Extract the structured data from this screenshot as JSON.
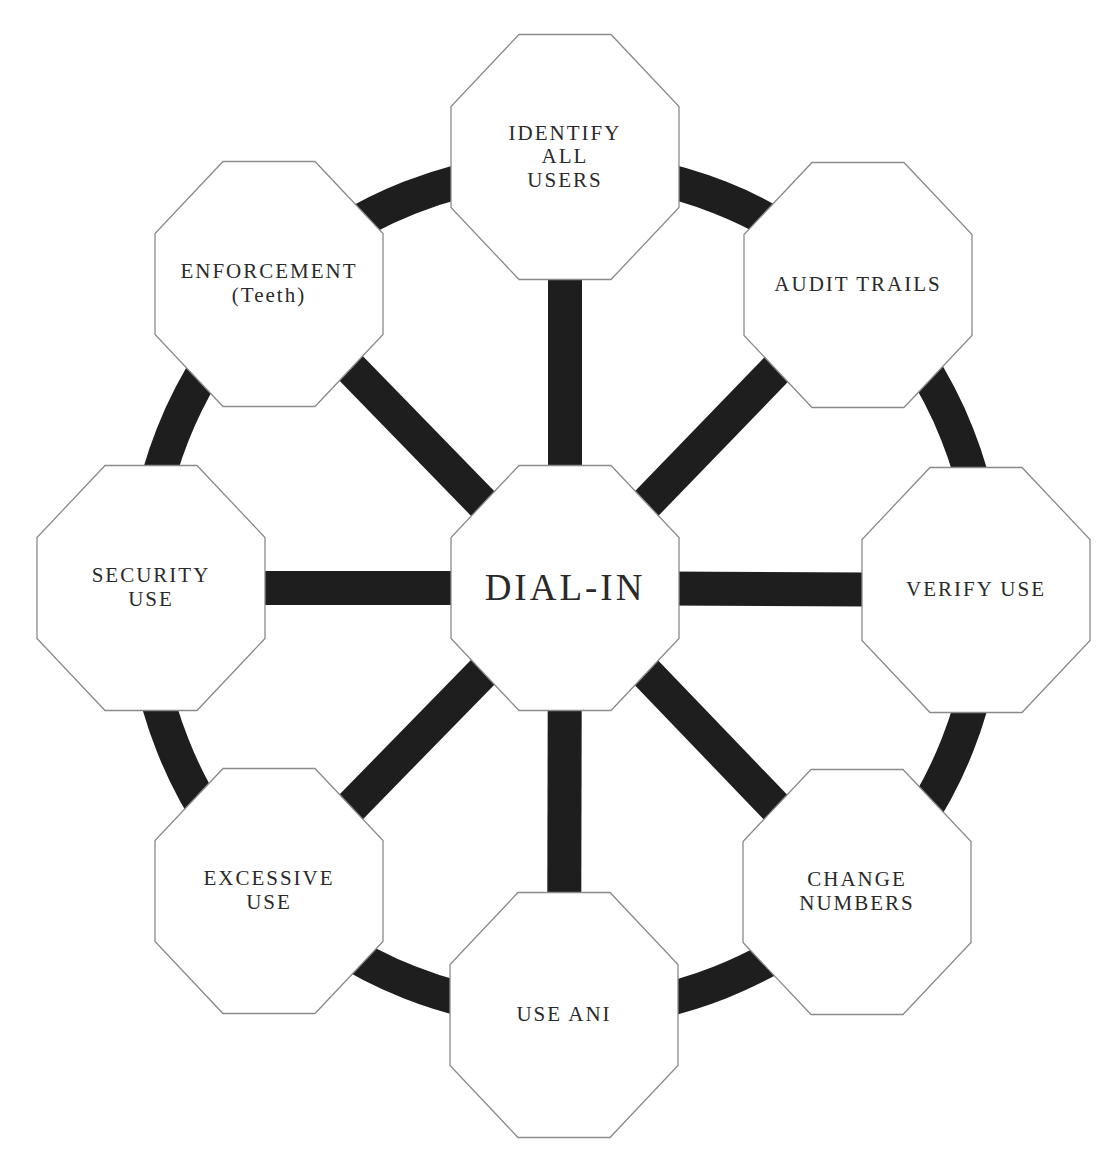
{
  "diagram": {
    "center": {
      "id": "dial-in",
      "lines": [
        "DIAL-IN"
      ],
      "cx": 565,
      "cy": 588
    },
    "nodes": [
      {
        "id": "identify-all-users",
        "lines": [
          "IDENTIFY",
          "ALL",
          "USERS"
        ],
        "cx": 565,
        "cy": 157
      },
      {
        "id": "audit-trails",
        "lines": [
          "AUDIT TRAILS"
        ],
        "cx": 858,
        "cy": 285
      },
      {
        "id": "verify-use",
        "lines": [
          "VERIFY USE"
        ],
        "cx": 976,
        "cy": 590
      },
      {
        "id": "change-numbers",
        "lines": [
          "CHANGE",
          "NUMBERS"
        ],
        "cx": 857,
        "cy": 892
      },
      {
        "id": "use-ani",
        "lines": [
          "USE ANI"
        ],
        "cx": 564,
        "cy": 1015
      },
      {
        "id": "excessive-use",
        "lines": [
          "EXCESSIVE",
          "USE"
        ],
        "cx": 269,
        "cy": 891
      },
      {
        "id": "security-use",
        "lines": [
          "SECURITY",
          "USE"
        ],
        "cx": 151,
        "cy": 588
      },
      {
        "id": "enforcement",
        "lines": [
          "ENFORCEMENT",
          "(Teeth)"
        ],
        "cx": 269,
        "cy": 284
      }
    ],
    "ring": {
      "cx": 565,
      "cy": 590,
      "r": 422,
      "stroke_width": 34
    },
    "spoke_width": 34,
    "octagon": {
      "width": 228,
      "height": 245,
      "cut_x": 68,
      "cut_y": 72
    },
    "colors": {
      "background": "#ffffff",
      "ring": "#1e1e1e",
      "spoke": "#1e1e1e",
      "octagon_fill": "#ffffff",
      "octagon_stroke": "#8a8a8a",
      "text": "#2a2a2a"
    }
  }
}
